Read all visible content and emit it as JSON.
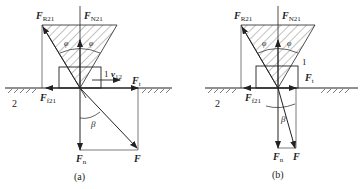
{
  "figure": {
    "panels": [
      {
        "id": "a",
        "caption": "(a)",
        "labels": {
          "F_R": "F",
          "F_R_sub": "R21",
          "F_N": "F",
          "F_N_sub": "N21",
          "phi_left": "φ",
          "phi_right": "φ",
          "body1": "1",
          "v": "v",
          "v_sub": "12",
          "F_t": "F",
          "F_t_sub": "t",
          "body2": "2",
          "F_f": "F",
          "F_f_sub": "f21",
          "beta": "β",
          "F_n": "F",
          "F_n_sub": "n",
          "F": "F"
        }
      },
      {
        "id": "b",
        "caption": "(b)",
        "labels": {
          "F_R": "F",
          "F_R_sub": "R21",
          "F_N": "F",
          "F_N_sub": "N21",
          "phi_left": "φ",
          "phi_right": "φ",
          "body1": "1",
          "F_t": "F",
          "F_t_sub": "t",
          "body2": "2",
          "F_f": "F",
          "F_f_sub": "f21",
          "beta": "β",
          "F_n": "F",
          "F_n_sub": "n",
          "F": "F"
        }
      }
    ],
    "colors": {
      "line": "#222222",
      "hatch": "#555555",
      "background": "#ffffff"
    }
  }
}
